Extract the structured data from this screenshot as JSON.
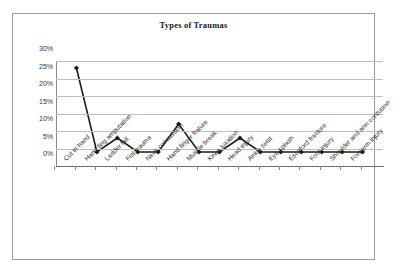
{
  "chart_data": {
    "type": "line",
    "title": "Types of Traumas",
    "xlabel": "",
    "ylabel": "",
    "ylim": [
      0,
      30
    ],
    "grid": true,
    "legend": "none",
    "categories": [
      "Cut in hand",
      "Hand fing amputation",
      "Ladder fall",
      "Fist trauma",
      "Neck concussion",
      "Hand finger frature",
      "Muscle break",
      "Knee luxation",
      "Head injury",
      "Ankle twist",
      "Eye splash",
      "Escaford fracture",
      "Foot injury",
      "Shoulder and arm contusion",
      "Forearm injury"
    ],
    "values": [
      28,
      4,
      8,
      4,
      4,
      12,
      4,
      4,
      8,
      4,
      4,
      4,
      4,
      4,
      4
    ],
    "ytick_labels": [
      "30%",
      "25%",
      "20%",
      "15%",
      "10%",
      "5%",
      "0%"
    ],
    "ytick_values": [
      30,
      25,
      20,
      15,
      10,
      5,
      0
    ],
    "series_name": "Types of Traumas",
    "marker": "diamond",
    "line_color": "#1c1c1c",
    "grid_color": "#bfbfbf"
  }
}
